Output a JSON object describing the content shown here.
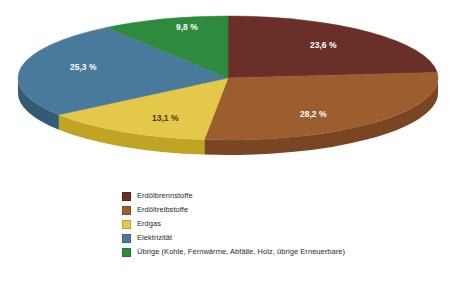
{
  "chart_data": {
    "type": "pie",
    "title": "",
    "xlabel": "",
    "ylabel": "",
    "legend_position": "bottom",
    "grid": false,
    "three_d": true,
    "start_angle_deg": 0,
    "direction": "clockwise",
    "categories": [
      "Erdölbrennstoffe",
      "Erdöltreibstoffe",
      "Erdgas",
      "Elektrizität",
      "Übrige (Kohle, Fernwärme, Abfälle, Holz, übrige Erneuerbare)"
    ],
    "values": [
      23.6,
      28.2,
      13.1,
      25.3,
      9.8
    ],
    "value_labels": [
      "23,6 %",
      "28,2 %",
      "13,1 %",
      "25,3 %",
      "9,8 %"
    ],
    "colors": [
      "#6B2F2A",
      "#9C5E2E",
      "#E3C84A",
      "#4A7A9B",
      "#2E8B3E"
    ]
  },
  "title_strip": {
    "text": ""
  },
  "slices": [
    {
      "name": "erdoelbrennstoffe",
      "label": "23,6 %",
      "color": "#6B2F2A",
      "side_color": "#4E211D",
      "value": 23.6,
      "label_x": 310,
      "label_y": 44,
      "label_class": "slice-label"
    },
    {
      "name": "erdoeltreibstoffe",
      "label": "28,2 %",
      "color": "#9C5E2E",
      "side_color": "#7A4522",
      "value": 28.2,
      "label_x": 300,
      "label_y": 113,
      "label_class": "slice-label"
    },
    {
      "name": "erdgas",
      "label": "13,1 %",
      "color": "#E3C84A",
      "side_color": "#C0A524",
      "value": 13.1,
      "label_x": 152,
      "label_y": 117,
      "label_class": "slice-label dark-text"
    },
    {
      "name": "elektrizitaet",
      "label": "25,3 %",
      "color": "#4A7A9B",
      "side_color": "#345B76",
      "value": 25.3,
      "label_x": 70,
      "label_y": 66,
      "label_class": "slice-label"
    },
    {
      "name": "uebrige",
      "label": "9,8 %",
      "color": "#2E8B3E",
      "side_color": "#206A2C",
      "value": 9.8,
      "label_x": 176,
      "label_y": 26,
      "label_class": "slice-label"
    }
  ],
  "legend": {
    "items": [
      {
        "label": "Erdölbrennstoffe",
        "color": "#6B2F2A"
      },
      {
        "label": "Erdöltreibstoffe",
        "color": "#9C5E2E"
      },
      {
        "label": "Erdgas",
        "color": "#E3C84A"
      },
      {
        "label": "Elektrizität",
        "color": "#4A7A9B"
      },
      {
        "label": "Übrige (Kohle, Fernwärme, Abfälle, Holz, übrige Erneuerbare)",
        "color": "#2E8B3E"
      }
    ]
  },
  "geometry": {
    "cx": 228,
    "cy": 74,
    "rx": 210,
    "ry": 62,
    "depth": 15
  }
}
